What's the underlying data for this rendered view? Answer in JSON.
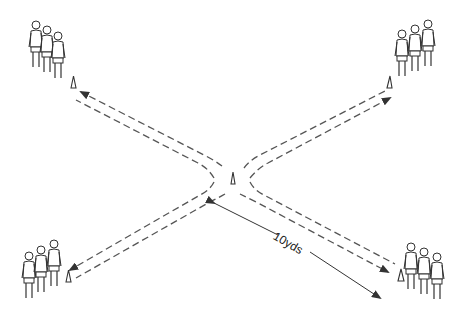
{
  "diagram": {
    "type": "sports-drill",
    "measurement_label": "10yds",
    "groups": [
      {
        "position": "top-left",
        "players": 3
      },
      {
        "position": "top-right",
        "players": 3
      },
      {
        "position": "bottom-left",
        "players": 3
      },
      {
        "position": "bottom-right",
        "players": 3
      }
    ],
    "cones": [
      {
        "position": "top-left"
      },
      {
        "position": "top-right"
      },
      {
        "position": "bottom-left"
      },
      {
        "position": "bottom-right"
      },
      {
        "position": "center"
      }
    ],
    "colors": {
      "line": "#555555",
      "outline": "#333333",
      "background": "#ffffff"
    }
  }
}
